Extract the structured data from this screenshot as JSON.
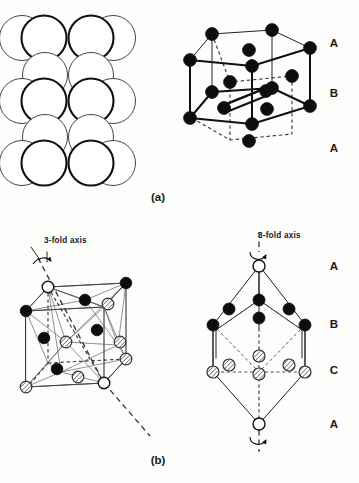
{
  "figure": {
    "title_panels": [
      "(a)",
      "(b)"
    ],
    "panel_a": {
      "caption": "(a)",
      "left_diagram": {
        "name": "close-packed-sphere-stacking",
        "description": "Close-packed spheres stacked in ABA sequence",
        "rows": [
          {
            "type": "thick",
            "count": 4,
            "y": 37,
            "x_start": 13,
            "spacing": 33.5,
            "r": 22.5
          },
          {
            "type": "thin",
            "count": 2,
            "y": 71,
            "x_start": 46,
            "spacing": 33.5,
            "r": 22.5
          },
          {
            "type": "thick",
            "count": 4,
            "y": 104,
            "x_start": 13,
            "spacing": 33.5,
            "r": 22.5
          },
          {
            "type": "thin",
            "count": 2,
            "y": 137,
            "x_start": 46,
            "spacing": 33.5,
            "r": 22.5
          },
          {
            "type": "thick",
            "count": 4,
            "y": 160,
            "x_start": 13,
            "spacing": 33.5,
            "r": 22.5
          }
        ]
      },
      "right_diagram": {
        "name": "hcp-unit-cell",
        "description": "Hexagonal close-packed unit cell",
        "layer_labels": [
          "A",
          "B",
          "A"
        ],
        "layer_label_y": [
          43,
          95,
          150
        ],
        "layer_label_x": 334,
        "atom_radius": 6.2,
        "atom_count": 17
      }
    },
    "panel_b": {
      "caption": "(b)",
      "left_diagram": {
        "name": "fcc-cube-3fold-axis",
        "description": "Face centred cubic cell with 3-fold axis along body diagonal",
        "axis_label": "3-fold axis",
        "axis_label_x": 44,
        "axis_label_y": 243,
        "atom_radius": 5.6
      },
      "right_diagram": {
        "name": "fcc-rhombohedral-layers",
        "description": "FCC viewed down 3-fold axis showing ABCA layer stacking",
        "axis_label": "3-fold axis",
        "axis_label_x": 258,
        "axis_label_y": 238,
        "layer_labels": [
          "A",
          "B",
          "C",
          "A"
        ],
        "layer_label_y": [
          268,
          324,
          372,
          424
        ],
        "layer_label_x": 334,
        "atom_radius": 5.8
      }
    },
    "legend_atom_types": [
      {
        "key": "open",
        "label": "A layer",
        "style": "open circle"
      },
      {
        "key": "black",
        "label": "B layer",
        "style": "filled black circle"
      },
      {
        "key": "hatched",
        "label": "C layer",
        "style": "diagonally hatched circle"
      }
    ],
    "colors": {
      "background": "#fdfdfc",
      "ink": "#111111",
      "atom_black": "#0d0d0d",
      "atom_open_fill": "#ffffff",
      "hatch_stroke": "#555555",
      "dash_line": "#555555"
    }
  }
}
